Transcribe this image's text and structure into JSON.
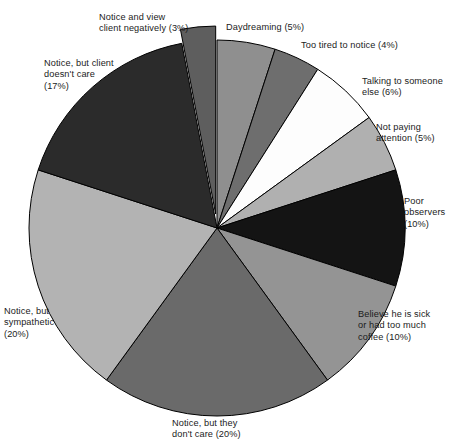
{
  "chart_data": {
    "type": "pie",
    "title": "",
    "subtitle": "",
    "xlabel": "",
    "ylabel": "",
    "legend_position": "none",
    "grid": false,
    "units": "percent",
    "total": 100,
    "start_angle_deg": -90,
    "direction": "clockwise",
    "categories": [
      "Daydreaming",
      "Too tired to notice",
      "Talking to someone else",
      "Not paying attention",
      "Poor observers",
      "Believe he is sick or had too much coffee",
      "Notice, but they don't care",
      "Notice, but sympathetic",
      "Notice, but client doesn't care",
      "Notice and view client negatively"
    ],
    "values": [
      5,
      4,
      6,
      5,
      10,
      10,
      20,
      20,
      17,
      3
    ],
    "colors": [
      "#8f8f8f",
      "#6e6e6e",
      "#fdfdfd",
      "#b0b0b0",
      "#141414",
      "#949494",
      "#6a6a6a",
      "#b3b3b3",
      "#2b2b2b",
      "#5e5e5e"
    ],
    "exploded": [
      false,
      false,
      false,
      false,
      false,
      false,
      false,
      false,
      false,
      true
    ],
    "slices": [
      {
        "label": "Daydreaming (5%)",
        "name": "Daydreaming",
        "value": 5,
        "color": "#8f8f8f",
        "label_x": 226,
        "label_y": 22,
        "align": "left"
      },
      {
        "label": "Too tired to notice (4%)",
        "name": "Too tired to notice",
        "value": 4,
        "color": "#6e6e6e",
        "label_x": 301,
        "label_y": 40,
        "align": "left"
      },
      {
        "label": "Talking to someone\nelse (6%)",
        "name": "Talking to someone else",
        "value": 6,
        "color": "#fdfdfd",
        "label_x": 362,
        "label_y": 76,
        "align": "left"
      },
      {
        "label": "Not paying\nattention (5%)",
        "name": "Not paying attention",
        "value": 5,
        "color": "#b0b0b0",
        "label_x": 376,
        "label_y": 122,
        "align": "left"
      },
      {
        "label": "Poor\nobservers\n(10%)",
        "name": "Poor observers",
        "value": 10,
        "color": "#141414",
        "label_x": 404,
        "label_y": 196,
        "align": "left"
      },
      {
        "label": "Believe he is sick\nor had too much\ncoffee (10%)",
        "name": "Believe he is sick or had too much coffee",
        "value": 10,
        "color": "#949494",
        "label_x": 358,
        "label_y": 309,
        "align": "left"
      },
      {
        "label": "Notice, but they\ndon't care (20%)",
        "name": "Notice, but they don't care",
        "value": 20,
        "color": "#6a6a6a",
        "label_x": 172,
        "label_y": 418,
        "align": "left"
      },
      {
        "label": "Notice, but\nsympathetic\n(20%)",
        "name": "Notice, but sympathetic",
        "value": 20,
        "color": "#b3b3b3",
        "label_x": 4,
        "label_y": 306,
        "align": "left"
      },
      {
        "label": "Notice, but client\ndoesn't care\n(17%)",
        "name": "Notice, but client doesn't care",
        "value": 17,
        "color": "#2b2b2b",
        "label_x": 44,
        "label_y": 58,
        "align": "left"
      },
      {
        "label": "Notice and view\nclient negatively (3%)",
        "name": "Notice and view client negatively",
        "value": 3,
        "color": "#5e5e5e",
        "label_x": 99,
        "label_y": 12,
        "align": "left"
      }
    ]
  },
  "geometry": {
    "center_x": 217,
    "center_y": 228,
    "radius": 188,
    "explode_offset": 14,
    "outline_color": "#000000",
    "background": "#ffffff"
  }
}
